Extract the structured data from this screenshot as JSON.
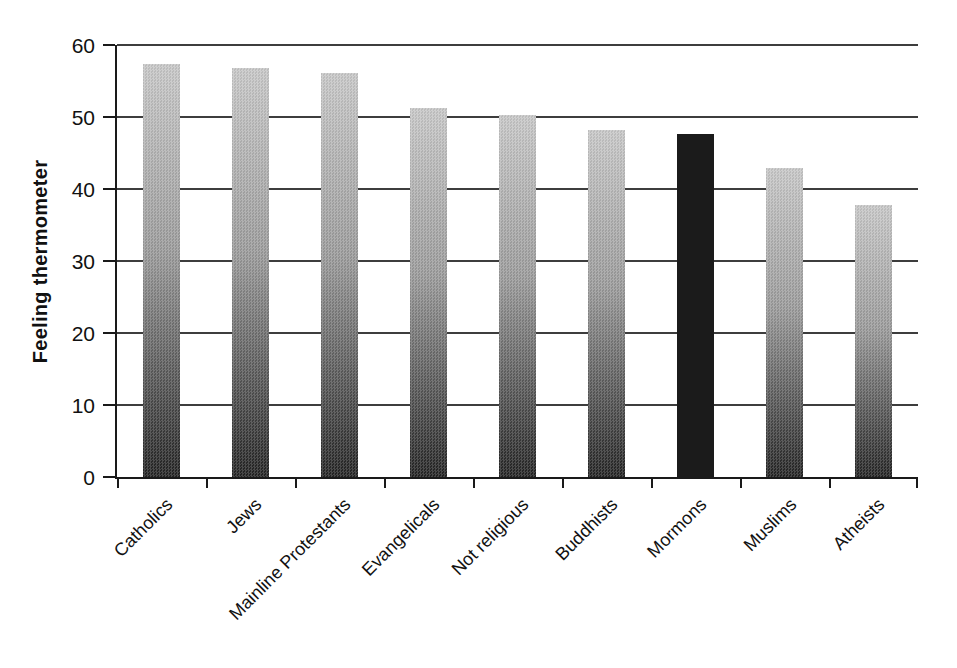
{
  "chart_data": {
    "type": "bar",
    "title": "",
    "xlabel": "",
    "ylabel": "Feeling thermometer",
    "ylim": [
      0,
      60
    ],
    "yticks": [
      0,
      10,
      20,
      30,
      40,
      50,
      60
    ],
    "grid": "horizontal-full-width",
    "legend": "none",
    "categories": [
      "Catholics",
      "Jews",
      "Mainline Protestants",
      "Evangelicals",
      "Not religious",
      "Buddhists",
      "Mormons",
      "Muslims",
      "Atheists"
    ],
    "values": [
      57.4,
      56.8,
      56.1,
      51.2,
      50.3,
      48.2,
      47.7,
      42.9,
      37.8
    ],
    "highlighted_category": "Mormons",
    "bar_fill": {
      "default_style": "vertical-gradient",
      "default_top_color": "#c7c7c7",
      "default_bottom_color": "#232323",
      "highlight_style": "solid",
      "highlight_color": "#1b1b1b"
    },
    "axis_color": "#1a1a1a",
    "gridline_color": "#3d3d3d",
    "x_tick_placement": "category-boundaries",
    "x_label_rotation_deg": 45
  }
}
